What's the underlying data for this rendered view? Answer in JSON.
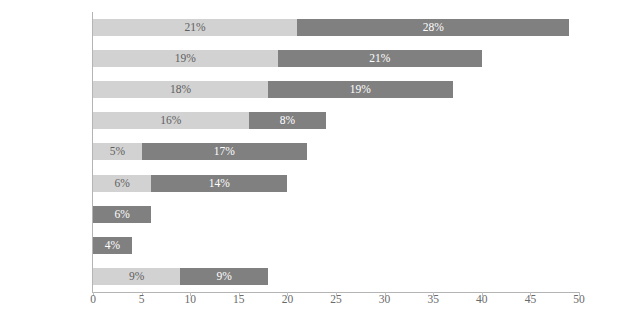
{
  "chart_data": {
    "type": "bar",
    "orientation": "horizontal",
    "stacked": true,
    "title": "",
    "subtitle": "",
    "xlabel": "",
    "ylabel": "",
    "xlim": [
      0,
      50
    ],
    "xticks": [
      "0",
      "5",
      "10",
      "15",
      "20",
      "25",
      "30",
      "35",
      "40",
      "45",
      "50"
    ],
    "xtick_values": [
      0,
      5,
      10,
      15,
      20,
      25,
      30,
      35,
      40,
      45,
      50
    ],
    "grid": false,
    "legend": "none",
    "categories": [
      "大型企业",
      "慈善组织",
      "政府",
      "投资者",
      "风险投资",
      "咨询服务",
      "股本回报",
      "投资交易费",
      "其他"
    ],
    "series": [
      {
        "name": "series-light",
        "color": "#d2d2d2",
        "values": [
          21,
          19,
          18,
          16,
          5,
          6,
          0,
          0,
          9
        ],
        "labels": [
          "21%",
          "19%",
          "18%",
          "16%",
          "5%",
          "6%",
          "",
          "",
          "9%"
        ]
      },
      {
        "name": "series-dark",
        "color": "#808080",
        "values": [
          28,
          21,
          19,
          8,
          17,
          14,
          6,
          4,
          9
        ],
        "labels": [
          "28%",
          "21%",
          "19%",
          "8%",
          "17%",
          "14%",
          "6%",
          "4%",
          "9%"
        ]
      }
    ],
    "totals": [
      49,
      40,
      37,
      24,
      22,
      20,
      6,
      4,
      18
    ],
    "colors": {
      "light_segment": "#d2d2d2",
      "dark_segment": "#808080",
      "axis": "#b4b4b4",
      "tick_text": "#6a6a6a",
      "category_text": "#222222",
      "background": "#ffffff"
    }
  },
  "rows": [
    {
      "label": "大型企业",
      "light": 21,
      "light_label": "21%",
      "dark": 28,
      "dark_label": "28%"
    },
    {
      "label": "慈善组织",
      "light": 19,
      "light_label": "19%",
      "dark": 21,
      "dark_label": "21%"
    },
    {
      "label": "政府",
      "light": 18,
      "light_label": "18%",
      "dark": 19,
      "dark_label": "19%"
    },
    {
      "label": "投资者",
      "light": 16,
      "light_label": "16%",
      "dark": 8,
      "dark_label": "8%"
    },
    {
      "label": "风险投资",
      "light": 5,
      "light_label": "5%",
      "dark": 17,
      "dark_label": "17%"
    },
    {
      "label": "咨询服务",
      "light": 6,
      "light_label": "6%",
      "dark": 14,
      "dark_label": "14%"
    },
    {
      "label": "股本回报",
      "light": 0,
      "light_label": "",
      "dark": 6,
      "dark_label": "6%"
    },
    {
      "label": "投资交易费",
      "light": 0,
      "light_label": "",
      "dark": 4,
      "dark_label": "4%"
    },
    {
      "label": "其他",
      "light": 9,
      "light_label": "9%",
      "dark": 9,
      "dark_label": "9%"
    }
  ],
  "axis": {
    "ticks": [
      "0",
      "5",
      "10",
      "15",
      "20",
      "25",
      "30",
      "35",
      "40",
      "45",
      "50"
    ]
  }
}
